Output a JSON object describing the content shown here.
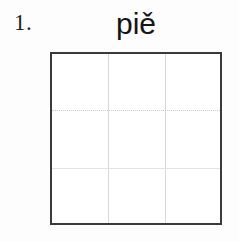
{
  "item": {
    "number_label": "1.",
    "word": "piě"
  },
  "grid": {
    "columns": 3,
    "rows": 3,
    "cells": [
      {
        "row": 1,
        "col": 1,
        "text": ""
      },
      {
        "row": 1,
        "col": 2,
        "text": ""
      },
      {
        "row": 1,
        "col": 3,
        "text": ""
      },
      {
        "row": 2,
        "col": 1,
        "text": ""
      },
      {
        "row": 2,
        "col": 2,
        "text": ""
      },
      {
        "row": 2,
        "col": 3,
        "text": ""
      },
      {
        "row": 3,
        "col": 1,
        "text": ""
      },
      {
        "row": 3,
        "col": 2,
        "text": ""
      },
      {
        "row": 3,
        "col": 3,
        "text": ""
      }
    ]
  },
  "colors": {
    "page_background": "#fdfdfd",
    "grid_background": "#ffffff",
    "grid_border": "#3a3a3a",
    "grid_divider_vertical": "#d8d8d8",
    "grid_divider_dotted": "#cfcfcf",
    "grid_divider_solid": "#e2e2e2",
    "number_text": "#1d1d1d",
    "word_text": "#151515"
  }
}
